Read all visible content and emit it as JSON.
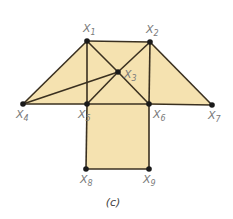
{
  "diagram": {
    "colors": {
      "fill": "#f5e2b0",
      "edge": "#3a3020",
      "node": "#1a1a1a",
      "label": "#7a7a7a"
    },
    "nodes": [
      {
        "id": "x1",
        "label": "X",
        "sub": "1",
        "x": 87,
        "y": 41
      },
      {
        "id": "x2",
        "label": "X",
        "sub": "2",
        "x": 150,
        "y": 42
      },
      {
        "id": "x3",
        "label": "X",
        "sub": "3",
        "x": 118,
        "y": 72
      },
      {
        "id": "x4",
        "label": "X",
        "sub": "4",
        "x": 23,
        "y": 104
      },
      {
        "id": "x5",
        "label": "X",
        "sub": "5",
        "x": 87,
        "y": 104
      },
      {
        "id": "x6",
        "label": "X",
        "sub": "6",
        "x": 149,
        "y": 104
      },
      {
        "id": "x7",
        "label": "X",
        "sub": "7",
        "x": 212,
        "y": 105
      },
      {
        "id": "x8",
        "label": "X",
        "sub": "8",
        "x": 86,
        "y": 169
      },
      {
        "id": "x9",
        "label": "X",
        "sub": "9",
        "x": 149,
        "y": 169
      }
    ],
    "edges": [
      [
        "x1",
        "x2"
      ],
      [
        "x1",
        "x4"
      ],
      [
        "x1",
        "x5"
      ],
      [
        "x1",
        "x3"
      ],
      [
        "x3",
        "x6"
      ],
      [
        "x2",
        "x3"
      ],
      [
        "x3",
        "x5"
      ],
      [
        "x2",
        "x6"
      ],
      [
        "x2",
        "x7"
      ],
      [
        "x4",
        "x5"
      ],
      [
        "x5",
        "x6"
      ],
      [
        "x6",
        "x7"
      ],
      [
        "x4",
        "x3"
      ],
      [
        "x5",
        "x8"
      ],
      [
        "x6",
        "x9"
      ],
      [
        "x8",
        "x9"
      ]
    ],
    "caption": "(c)"
  }
}
